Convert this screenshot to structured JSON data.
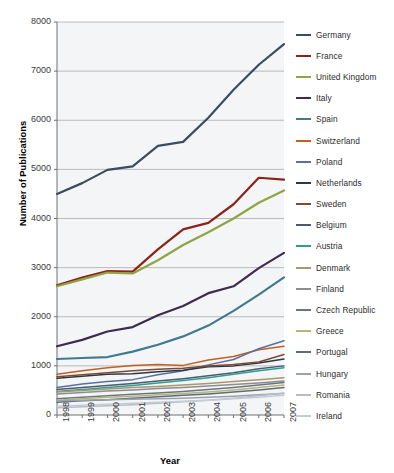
{
  "chart_data": {
    "type": "line",
    "title": "",
    "xlabel": "Year",
    "ylabel": "Number of Publications",
    "x": [
      1998,
      1999,
      2000,
      2001,
      2002,
      2003,
      2004,
      2005,
      2006,
      2007
    ],
    "categories": [
      "1998",
      "1999",
      "2000",
      "2001",
      "2002",
      "2003",
      "2004",
      "2005",
      "2006",
      "2007"
    ],
    "xlim": [
      1998,
      2007
    ],
    "ylim": [
      0,
      8000
    ],
    "yticks": [
      0,
      1000,
      2000,
      3000,
      4000,
      5000,
      6000,
      7000,
      8000
    ],
    "grid": "horizontal",
    "legend_position": "right",
    "series": [
      {
        "name": "Germany",
        "color": "#3d4a63",
        "values": [
          4500,
          4720,
          4990,
          5060,
          5480,
          5560,
          6050,
          6620,
          7130,
          7550
        ]
      },
      {
        "name": "France",
        "color": "#8c2318",
        "values": [
          2640,
          2800,
          2930,
          2920,
          3370,
          3780,
          3910,
          4290,
          4830,
          4790
        ]
      },
      {
        "name": "United Kingdom",
        "color": "#8fa543",
        "values": [
          2620,
          2760,
          2900,
          2880,
          3150,
          3460,
          3720,
          4000,
          4320,
          4570
        ]
      },
      {
        "name": "Italy",
        "color": "#3e2b4f",
        "values": [
          1400,
          1530,
          1700,
          1790,
          2030,
          2220,
          2480,
          2620,
          2990,
          3300
        ]
      },
      {
        "name": "Spain",
        "color": "#3f7b8c",
        "values": [
          1140,
          1160,
          1180,
          1290,
          1430,
          1600,
          1820,
          2120,
          2450,
          2800
        ]
      },
      {
        "name": "Switzerland",
        "color": "#c1601f",
        "values": [
          830,
          900,
          960,
          1010,
          1030,
          1010,
          1120,
          1190,
          1330,
          1400
        ]
      },
      {
        "name": "Poland",
        "color": "#5b6ea0",
        "values": [
          560,
          630,
          680,
          720,
          820,
          900,
          1020,
          1130,
          1350,
          1510
        ]
      },
      {
        "name": "Netherlands",
        "color": "#2f3740",
        "values": [
          750,
          790,
          830,
          840,
          880,
          910,
          980,
          1000,
          1060,
          1140
        ]
      },
      {
        "name": "Sweden",
        "color": "#7c4b35",
        "values": [
          780,
          820,
          860,
          900,
          930,
          950,
          1000,
          1030,
          1080,
          1230
        ]
      },
      {
        "name": "Belgium",
        "color": "#4a5a73",
        "values": [
          520,
          560,
          600,
          640,
          690,
          740,
          800,
          860,
          940,
          1000
        ]
      },
      {
        "name": "Austria",
        "color": "#2f9e8f",
        "values": [
          480,
          520,
          560,
          600,
          650,
          700,
          760,
          830,
          900,
          960
        ]
      },
      {
        "name": "Denmark",
        "color": "#a99772",
        "values": [
          470,
          500,
          530,
          560,
          580,
          610,
          640,
          680,
          720,
          760
        ]
      },
      {
        "name": "Finland",
        "color": "#8b8d8f",
        "values": [
          430,
          460,
          490,
          510,
          540,
          560,
          590,
          620,
          650,
          690
        ]
      },
      {
        "name": "Czech Republic",
        "color": "#6b7482",
        "values": [
          330,
          360,
          390,
          420,
          450,
          480,
          520,
          560,
          610,
          660
        ]
      },
      {
        "name": "Greece",
        "color": "#b5b77a",
        "values": [
          300,
          330,
          360,
          380,
          410,
          440,
          470,
          510,
          560,
          610
        ]
      },
      {
        "name": "Portugal",
        "color": "#5e6b7a",
        "values": [
          260,
          290,
          310,
          340,
          370,
          400,
          430,
          470,
          510,
          560
        ]
      },
      {
        "name": "Hungary",
        "color": "#9aa3ad",
        "values": [
          290,
          300,
          310,
          320,
          330,
          340,
          360,
          380,
          410,
          440
        ]
      },
      {
        "name": "Romania",
        "color": "#b8bcc4",
        "values": [
          150,
          170,
          190,
          210,
          240,
          270,
          300,
          340,
          390,
          450
        ]
      },
      {
        "name": "Ireland",
        "color": "#c3cdd8",
        "values": [
          180,
          200,
          220,
          240,
          260,
          280,
          300,
          330,
          360,
          400
        ]
      }
    ]
  },
  "axes": {
    "ylabel": "Number of Publications",
    "xlabel": "Year",
    "yticks": [
      "8000",
      "7000",
      "6000",
      "5000",
      "4000",
      "3000",
      "2000",
      "1000",
      "0"
    ],
    "xticks": [
      "1998",
      "1999",
      "2000",
      "2001",
      "2002",
      "2003",
      "2004",
      "2005",
      "2006",
      "2007"
    ]
  },
  "legend": {
    "items": [
      {
        "label": "Germany"
      },
      {
        "label": "France"
      },
      {
        "label": "United Kingdom"
      },
      {
        "label": "Italy"
      },
      {
        "label": "Spain"
      },
      {
        "label": "Switzerland"
      },
      {
        "label": "Poland"
      },
      {
        "label": "Netherlands"
      },
      {
        "label": "Sweden"
      },
      {
        "label": "Belgium"
      },
      {
        "label": "Austria"
      },
      {
        "label": "Denmark"
      },
      {
        "label": "Finland"
      },
      {
        "label": "Czech Republic"
      },
      {
        "label": "Greece"
      },
      {
        "label": "Portugal"
      },
      {
        "label": "Hungary"
      },
      {
        "label": "Romania"
      },
      {
        "label": "Ireland"
      }
    ]
  },
  "colors": {
    "plot_background": "#f4f5f6",
    "gridline": "#a8abae",
    "axis": "#6d7073",
    "text": "#2b2b2b"
  }
}
